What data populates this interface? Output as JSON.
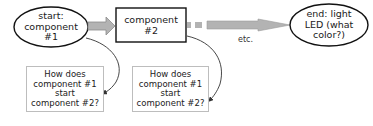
{
  "diagram": {
    "nodes": {
      "start": {
        "line1": "start:",
        "line2": "component",
        "line3": "#1"
      },
      "component2": {
        "line1": "component",
        "line2": "#2"
      },
      "end": {
        "line1": "end: light",
        "line2": "LED (what",
        "line3": "color?)"
      }
    },
    "etc_label": "etc.",
    "questions": [
      {
        "line1": "How does",
        "line2": "component #1",
        "line3": "start",
        "line4": "component #2?"
      },
      {
        "line1": "How does",
        "line2": "component #1",
        "line3": "start",
        "line4": "component #2?"
      }
    ],
    "colors": {
      "arrow_fill": "#b3b3b3",
      "arrow_stroke": "#8c8c8c",
      "shape_stroke": "#111111",
      "question_border": "#bdbdbd",
      "connector": "#333333"
    }
  }
}
